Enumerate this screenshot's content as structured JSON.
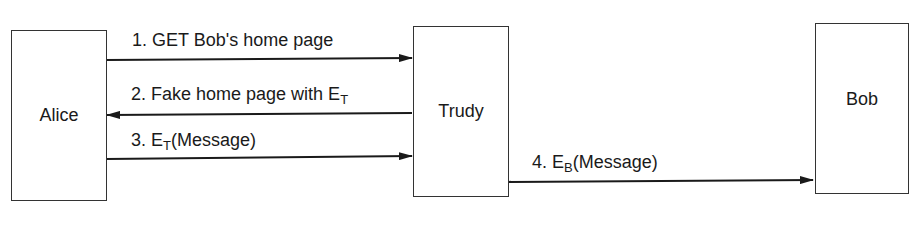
{
  "diagram": {
    "nodes": [
      {
        "id": "alice",
        "label": "Alice"
      },
      {
        "id": "trudy",
        "label": "Trudy"
      },
      {
        "id": "bob",
        "label": "Bob"
      }
    ],
    "messages": [
      {
        "from": "alice",
        "to": "trudy",
        "prefix": "1. GET Bob's home page",
        "sub": "",
        "suffix": ""
      },
      {
        "from": "trudy",
        "to": "alice",
        "prefix": "2. Fake home page with E",
        "sub": "T",
        "suffix": ""
      },
      {
        "from": "alice",
        "to": "trudy",
        "prefix": "3. E",
        "sub": "T",
        "suffix": "(Message)"
      },
      {
        "from": "trudy",
        "to": "bob",
        "prefix": "4. E",
        "sub": "B",
        "suffix": "(Message)"
      }
    ]
  }
}
